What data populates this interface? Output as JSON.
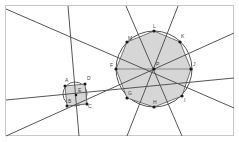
{
  "diagram": {
    "colors": {
      "frame": "#c8c8c8",
      "line": "#555555",
      "circle": "#555555",
      "polygon_fill": "#d6d6d6",
      "vertex": "#1a1a1a"
    },
    "small_polygon": {
      "center_label": "E",
      "vertex_labels": [
        "A",
        "D",
        "C",
        "B"
      ]
    },
    "large_polygon": {
      "center_label": "P",
      "vertex_labels": [
        "L",
        "K",
        "J",
        "I",
        "H",
        "G",
        "F",
        "M"
      ]
    }
  }
}
